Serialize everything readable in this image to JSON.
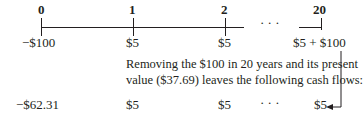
{
  "timeline": {
    "periods": [
      "0",
      "1",
      "2",
      "20"
    ],
    "ellipsis": "· · ·",
    "cash_flows": [
      "−$100",
      "$5",
      "$5",
      "$5 + $100"
    ]
  },
  "annotation": {
    "line1": "Removing the $100 in 20 years and its present",
    "line2": "value ($37.69) leaves the following cash flows:"
  },
  "result_row": {
    "cash_flows": [
      "−$62.31",
      "$5",
      "$5",
      "$5"
    ],
    "ellipsis": "· · ·"
  }
}
